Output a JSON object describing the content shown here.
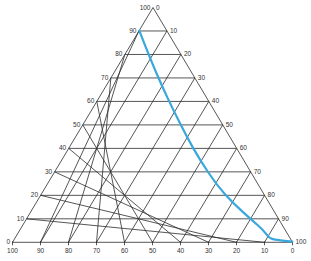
{
  "diagram": {
    "type": "ternary",
    "grid_step": 10,
    "colors": {
      "grid": "#2b2b2b",
      "curve": "#3aa8dc",
      "labels": "#333333",
      "background": "#ffffff"
    },
    "left_axis_labels": [
      "0",
      "10",
      "20",
      "30",
      "40",
      "50",
      "60",
      "70",
      "80",
      "90",
      "100"
    ],
    "right_axis_labels": [
      "0",
      "10",
      "20",
      "30",
      "40",
      "50",
      "60",
      "70",
      "80",
      "90",
      "100"
    ],
    "bottom_axis_labels": [
      "100",
      "90",
      "80",
      "70",
      "60",
      "50",
      "40",
      "30",
      "20",
      "10",
      "0"
    ],
    "curve": {
      "description": "Binodal curve from left-edge 90 mark down to bottom-right vertex",
      "points_px": [
        [
          139.3,
          30.7
        ],
        [
          150,
          58.3
        ],
        [
          162.3,
          86.7
        ],
        [
          173.3,
          110
        ],
        [
          186.7,
          136.7
        ],
        [
          200,
          160
        ],
        [
          216.7,
          185
        ],
        [
          233.3,
          203.3
        ],
        [
          251.7,
          220
        ],
        [
          263.3,
          230
        ],
        [
          269.3,
          238.3
        ],
        [
          276.7,
          240
        ],
        [
          292.3,
          241.7
        ]
      ]
    }
  }
}
